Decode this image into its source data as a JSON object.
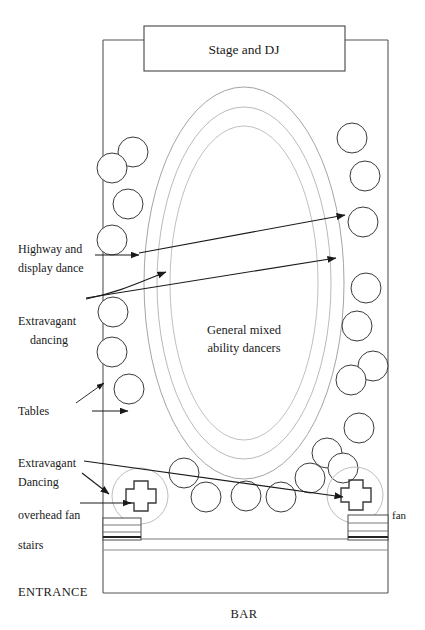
{
  "figure": {
    "stage_label": "Stage and DJ",
    "centre_label_line1": "General mixed",
    "centre_label_line2": "ability dancers",
    "bar_label": "BAR",
    "entrance_label": "ENTRANCE",
    "fan_right_label": "fan"
  },
  "labels": {
    "highway_line1": "Highway and",
    "highway_line2": "display dance",
    "extravagant_line1": "Extravagant",
    "extravagant_line2": "dancing",
    "tables": "Tables",
    "extravagant2_line1": "Extravagant",
    "extravagant2_line2": "Dancing",
    "overhead_fan": "overhead fan",
    "stairs": "stairs"
  },
  "colors": {
    "ink": "#1a1a1a",
    "line": "#3a3a3a",
    "faint": "#8a8a8a",
    "paper": "#ffffff"
  },
  "geometry": {
    "room": {
      "x": 103,
      "y": 40,
      "width": 285,
      "height": 553
    },
    "stage": {
      "x": 144,
      "y": 26,
      "width": 201,
      "height": 45
    },
    "dancefloor_center": {
      "cx": 244,
      "cy": 283
    },
    "rings": [
      {
        "name": "outer-ring",
        "rx": 100,
        "ry": 196
      },
      {
        "name": "middle-ring",
        "rx": 87,
        "ry": 176
      },
      {
        "name": "inner-ring",
        "rx": 74,
        "ry": 157
      }
    ],
    "tables": [
      {
        "cx": 133,
        "cy": 152,
        "r": 15
      },
      {
        "cx": 112,
        "cy": 168,
        "r": 15
      },
      {
        "cx": 128,
        "cy": 204,
        "r": 15
      },
      {
        "cx": 112,
        "cy": 240,
        "r": 15
      },
      {
        "cx": 113,
        "cy": 312,
        "r": 15
      },
      {
        "cx": 112,
        "cy": 352,
        "r": 15
      },
      {
        "cx": 129,
        "cy": 389,
        "r": 15
      },
      {
        "cx": 184,
        "cy": 473,
        "r": 15
      },
      {
        "cx": 206,
        "cy": 497,
        "r": 15
      },
      {
        "cx": 246,
        "cy": 496,
        "r": 15
      },
      {
        "cx": 281,
        "cy": 497,
        "r": 15
      },
      {
        "cx": 310,
        "cy": 478,
        "r": 15
      },
      {
        "cx": 327,
        "cy": 453,
        "r": 15
      },
      {
        "cx": 343,
        "cy": 468,
        "r": 15
      },
      {
        "cx": 352,
        "cy": 138,
        "r": 15
      },
      {
        "cx": 365,
        "cy": 176,
        "r": 15
      },
      {
        "cx": 363,
        "cy": 222,
        "r": 15
      },
      {
        "cx": 366,
        "cy": 288,
        "r": 15
      },
      {
        "cx": 357,
        "cy": 326,
        "r": 15
      },
      {
        "cx": 373,
        "cy": 366,
        "r": 15
      },
      {
        "cx": 351,
        "cy": 380,
        "r": 15
      },
      {
        "cx": 359,
        "cy": 428,
        "r": 15
      }
    ],
    "fans": [
      {
        "name": "left-fan",
        "cx": 140,
        "cy": 496,
        "r": 28
      },
      {
        "name": "right-fan",
        "cx": 355,
        "cy": 495,
        "r": 28
      }
    ],
    "stairs": [
      {
        "name": "left-stairs",
        "x": 103,
        "y": 518,
        "width": 38,
        "height": 22
      },
      {
        "name": "right-stairs",
        "x": 348,
        "y": 515,
        "width": 40,
        "height": 25
      }
    ]
  }
}
